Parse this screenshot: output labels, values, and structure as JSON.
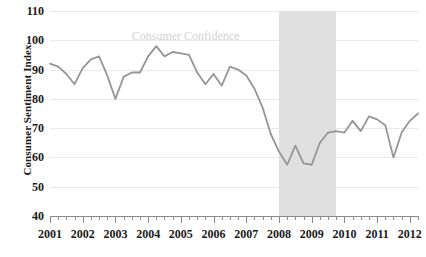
{
  "chart_data": {
    "type": "line",
    "title": "",
    "xlabel": "",
    "ylabel": "Consumer Sentiment Index",
    "ylim": [
      40,
      110
    ],
    "ytick_step": 10,
    "yticks": [
      110,
      100,
      90,
      80,
      70,
      60,
      50,
      40
    ],
    "xlim": [
      2001.0,
      2012.25
    ],
    "xticks": [
      2001,
      2002,
      2003,
      2004,
      2005,
      2006,
      2007,
      2008,
      2009,
      2010,
      2011,
      2012
    ],
    "xtick_labels": [
      "2001",
      "2002",
      "2003",
      "2004",
      "2005",
      "2006",
      "2007",
      "2008",
      "2009",
      "2010",
      "2011",
      "2012"
    ],
    "minor_ticks_per_year": 4,
    "grid": "horizontal",
    "legend": "none",
    "annotations": [
      {
        "name": "consumer-confidence-label",
        "text": "Consumer Confidence",
        "x": 2003.5,
        "y": 101.5,
        "color": "#d2d2d2"
      }
    ],
    "shaded_regions": [
      {
        "name": "recession-band",
        "label": "",
        "x_start": 2008.0,
        "x_end": 2009.75,
        "color": "#e0e0e0"
      }
    ],
    "series": [
      {
        "name": "Consumer Confidence",
        "color": "#969696",
        "line_width": 1.8,
        "x": [
          2001.0,
          2001.25,
          2001.5,
          2001.75,
          2002.0,
          2002.25,
          2002.5,
          2002.75,
          2003.0,
          2003.25,
          2003.5,
          2003.75,
          2004.0,
          2004.25,
          2004.5,
          2004.75,
          2005.0,
          2005.25,
          2005.5,
          2005.75,
          2006.0,
          2006.25,
          2006.5,
          2006.75,
          2007.0,
          2007.25,
          2007.5,
          2007.75,
          2008.0,
          2008.25,
          2008.5,
          2008.75,
          2009.0,
          2009.25,
          2009.5,
          2009.75,
          2010.0,
          2010.25,
          2010.5,
          2010.75,
          2011.0,
          2011.25,
          2011.5,
          2011.75,
          2012.0,
          2012.25
        ],
        "values": [
          92.0,
          91.0,
          88.5,
          85.0,
          90.5,
          93.5,
          94.5,
          88.0,
          80.0,
          87.5,
          89.0,
          89.0,
          94.5,
          98.0,
          94.5,
          96.0,
          95.5,
          95.0,
          89.0,
          85.0,
          88.5,
          84.5,
          91.0,
          90.0,
          88.0,
          83.5,
          77.0,
          68.0,
          62.0,
          57.5,
          64.0,
          58.0,
          57.5,
          65.0,
          68.5,
          69.0,
          68.5,
          72.5,
          69.0,
          74.0,
          73.0,
          71.0,
          60.0,
          68.5,
          72.5,
          75.0
        ]
      }
    ]
  }
}
